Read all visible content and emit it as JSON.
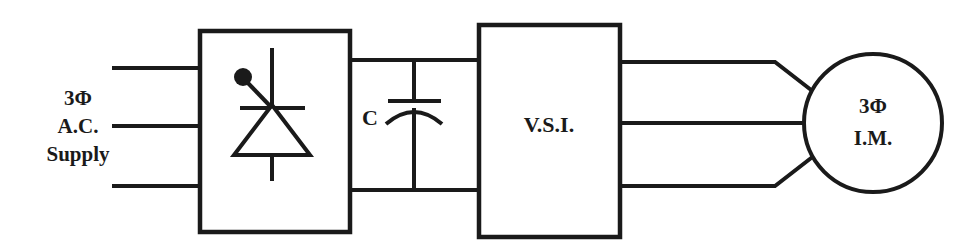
{
  "diagram": {
    "background_color": "#ffffff",
    "line_color": "#1a1a1a",
    "supply_label": {
      "line1": "3Φ",
      "line2": "A.C.",
      "line3": "Supply"
    },
    "rectifier": {
      "symbol_name": "thyristor-scr",
      "caption": ""
    },
    "capacitor": {
      "label": "C",
      "symbol_name": "polarized-capacitor"
    },
    "inverter": {
      "label": "V.S.I."
    },
    "motor": {
      "line1": "3Φ",
      "line2": "I.M."
    },
    "input_phases": [
      "phase-a",
      "phase-b",
      "phase-c"
    ],
    "output_phases": [
      "phase-u",
      "phase-v",
      "phase-w"
    ],
    "dc_link": [
      "dc-positive-rail",
      "dc-negative-rail"
    ]
  }
}
